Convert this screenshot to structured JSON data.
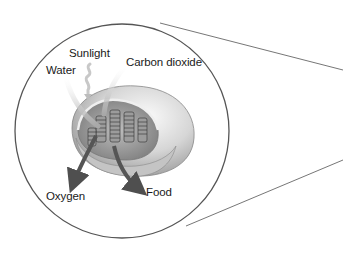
{
  "diagram": {
    "labels": {
      "sunlight": "Sunlight",
      "water": "Water",
      "carbon_dioxide": "Carbon dioxide",
      "oxygen": "Oxygen",
      "food": "Food"
    },
    "inputs": [
      "Sunlight",
      "Water",
      "Carbon dioxide"
    ],
    "outputs": [
      "Oxygen",
      "Food"
    ],
    "colors": {
      "outline": "#555555",
      "arrow": "#555555",
      "arrow_light": "#bdbdbd",
      "organelle": "#d9d9d9",
      "text": "#1a1a1a"
    }
  }
}
